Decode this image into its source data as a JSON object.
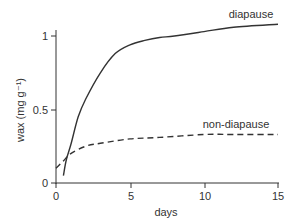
{
  "chart_data": {
    "type": "line",
    "title": "",
    "xlabel": "days",
    "ylabel": "wax (mg g⁻¹)",
    "xlim": [
      0,
      15
    ],
    "ylim": [
      0,
      1.1
    ],
    "xticks": [
      0,
      5,
      10,
      15
    ],
    "xtick_labels": [
      "0",
      "5",
      "10",
      "15"
    ],
    "yticks": [
      0,
      0.5,
      1
    ],
    "ytick_labels": [
      "0",
      "0.5",
      "1"
    ],
    "grid": false,
    "legend_position": "inline labels",
    "series": [
      {
        "name": "diapause",
        "style": "solid",
        "color": "#333333",
        "x": [
          0.5,
          0.7,
          1.0,
          1.5,
          2.0,
          3.0,
          4.0,
          5.0,
          6.0,
          7.0,
          8.0,
          10.0,
          12.0,
          15.0
        ],
        "values": [
          0.05,
          0.16,
          0.26,
          0.45,
          0.57,
          0.75,
          0.88,
          0.94,
          0.97,
          0.99,
          1.0,
          1.03,
          1.06,
          1.08
        ]
      },
      {
        "name": "non-diapause",
        "style": "dashed",
        "color": "#333333",
        "x": [
          0.0,
          0.5,
          1.0,
          2.0,
          3.0,
          5.0,
          7.0,
          10.0,
          12.0,
          15.0
        ],
        "values": [
          0.1,
          0.15,
          0.2,
          0.25,
          0.27,
          0.3,
          0.31,
          0.33,
          0.33,
          0.33
        ]
      }
    ],
    "annotations": [
      {
        "text": "diapause",
        "near": "end of solid curve, upper right"
      },
      {
        "text": "non-diapause",
        "near": "end of dashed curve, right"
      }
    ]
  },
  "labels": {
    "xlabel": "days",
    "ylabel": "wax (mg g⁻¹)",
    "series_diapause": "diapause",
    "series_nondiapause": "non-diapause",
    "xtick_0": "0",
    "xtick_5": "5",
    "xtick_10": "10",
    "xtick_15": "15",
    "ytick_0": "0",
    "ytick_05": "0.5",
    "ytick_1": "1"
  }
}
